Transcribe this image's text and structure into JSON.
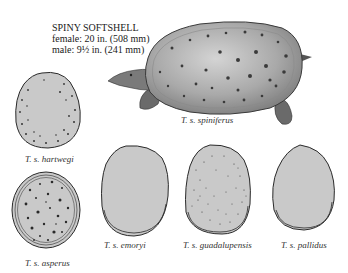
{
  "header": {
    "title": "SPINY SOFTSHELL",
    "female_size": "female: 20 in. (508 mm)",
    "male_size": "male: 9½ in. (241 mm)"
  },
  "main_figure": {
    "label": "T. s. spiniferus"
  },
  "shells": [
    {
      "label": "T. s. hartwegi",
      "pattern": "small dark dots near rim"
    },
    {
      "label": "T. s. asperus",
      "pattern": "dark spots, multiple rim lines"
    },
    {
      "label": "T. s. emoryi",
      "pattern": "plain, pale rim"
    },
    {
      "label": "T. s. guadalupensis",
      "pattern": "fine speckles"
    },
    {
      "label": "T. s. pallidus",
      "pattern": "plain, pale rim"
    }
  ],
  "colors": {
    "shell_fill": "#c8c8c8",
    "outline": "#2a2a2a",
    "spot": "#333333",
    "background": "#ffffff"
  }
}
